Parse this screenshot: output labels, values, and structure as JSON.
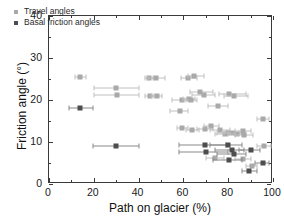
{
  "chart_data": {
    "type": "scatter",
    "title": "",
    "xlabel": "Path on glacier (%)",
    "ylabel": "Friction angle (°)",
    "xlim": [
      0,
      100
    ],
    "ylim": [
      0,
      40
    ],
    "xticks": [
      0,
      20,
      40,
      60,
      80,
      100
    ],
    "yticks": [
      0,
      10,
      20,
      30,
      40
    ],
    "xtick_minor_step": 10,
    "ytick_minor_step": 5,
    "grid": false,
    "legend_position": "upper left",
    "colors": {
      "travel": "#a9a9a9",
      "basal": "#4d4d4d",
      "axis": "#3a3a3a",
      "text": "#111111",
      "background": "#ffffff"
    },
    "series": [
      {
        "name": "Travel angles",
        "marker": "square",
        "color": "#a9a9a9",
        "points": [
          {
            "x": 14.0,
            "y": 25.5,
            "xerr_lo": 11.5,
            "xerr_hi": 16.5
          },
          {
            "x": 29.8,
            "y": 22.8,
            "xerr_lo": 20.0,
            "xerr_hi": 40.0
          },
          {
            "x": 30.2,
            "y": 21.3,
            "xerr_lo": 20.0,
            "xerr_hi": 40.0
          },
          {
            "x": 44.8,
            "y": 25.3,
            "xerr_lo": 43.0,
            "xerr_hi": 46.5
          },
          {
            "x": 47.8,
            "y": 25.2,
            "xerr_lo": 44.0,
            "xerr_hi": 52.0
          },
          {
            "x": 45.0,
            "y": 21.0,
            "xerr_lo": 43.0,
            "xerr_hi": 47.0
          },
          {
            "x": 48.0,
            "y": 20.9,
            "xerr_lo": 45.5,
            "xerr_hi": 50.5
          },
          {
            "x": 58.5,
            "y": 17.3,
            "xerr_lo": 54.0,
            "xerr_hi": 62.0
          },
          {
            "x": 59.5,
            "y": 20.0,
            "xerr_lo": 55.0,
            "xerr_hi": 63.0
          },
          {
            "x": 62.0,
            "y": 25.3,
            "xerr_lo": 59.0,
            "xerr_hi": 66.0
          },
          {
            "x": 64.8,
            "y": 25.6,
            "xerr_lo": 62.0,
            "xerr_hi": 69.0
          },
          {
            "x": 62.5,
            "y": 20.3,
            "xerr_lo": 60.0,
            "xerr_hi": 65.0
          },
          {
            "x": 63.5,
            "y": 19.9,
            "xerr_lo": 61.0,
            "xerr_hi": 66.0
          },
          {
            "x": 67.5,
            "y": 21.8,
            "xerr_lo": 63.0,
            "xerr_hi": 73.0
          },
          {
            "x": 69.0,
            "y": 21.3,
            "xerr_lo": 64.0,
            "xerr_hi": 74.0
          },
          {
            "x": 75.5,
            "y": 18.5,
            "xerr_lo": 71.0,
            "xerr_hi": 80.0
          },
          {
            "x": 80.5,
            "y": 21.4,
            "xerr_lo": 76.0,
            "xerr_hi": 88.0
          },
          {
            "x": 82.5,
            "y": 20.9,
            "xerr_lo": 78.0,
            "xerr_hi": 89.0
          },
          {
            "x": 59.5,
            "y": 13.4,
            "xerr_lo": 57.0,
            "xerr_hi": 62.0
          },
          {
            "x": 64.0,
            "y": 12.8,
            "xerr_lo": 61.0,
            "xerr_hi": 67.0
          },
          {
            "x": 69.5,
            "y": 13.0,
            "xerr_lo": 66.0,
            "xerr_hi": 73.0
          },
          {
            "x": 72.5,
            "y": 13.7,
            "xerr_lo": 69.0,
            "xerr_hi": 76.0
          },
          {
            "x": 76.5,
            "y": 12.8,
            "xerr_lo": 72.0,
            "xerr_hi": 81.0
          },
          {
            "x": 78.5,
            "y": 12.0,
            "xerr_lo": 74.0,
            "xerr_hi": 83.0
          },
          {
            "x": 80.0,
            "y": 12.2,
            "xerr_lo": 75.0,
            "xerr_hi": 85.0
          },
          {
            "x": 82.0,
            "y": 12.1,
            "xerr_lo": 78.0,
            "xerr_hi": 86.0
          },
          {
            "x": 84.0,
            "y": 12.0,
            "xerr_lo": 80.0,
            "xerr_hi": 88.0
          },
          {
            "x": 86.5,
            "y": 12.6,
            "xerr_lo": 83.0,
            "xerr_hi": 90.0
          },
          {
            "x": 87.0,
            "y": 11.6,
            "xerr_lo": 83.0,
            "xerr_hi": 91.0
          },
          {
            "x": 95.5,
            "y": 15.4,
            "xerr_lo": 93.0,
            "xerr_hi": 98.0
          },
          {
            "x": 96.0,
            "y": 9.0,
            "xerr_lo": 93.0,
            "xerr_hi": 99.0
          },
          {
            "x": 74.0,
            "y": 6.1,
            "xerr_lo": 70.0,
            "xerr_hi": 78.0
          },
          {
            "x": 86.5,
            "y": 6.0,
            "xerr_lo": 83.0,
            "xerr_hi": 90.0
          },
          {
            "x": 90.5,
            "y": 4.4,
            "xerr_lo": 88.0,
            "xerr_hi": 93.0
          }
        ]
      },
      {
        "name": "Basal friction angles",
        "marker": "square",
        "color": "#4d4d4d",
        "points": [
          {
            "x": 13.8,
            "y": 18.0,
            "xerr_lo": 9.0,
            "xerr_hi": 19.5
          },
          {
            "x": 30.0,
            "y": 9.0,
            "xerr_lo": 19.5,
            "xerr_hi": 40.0
          },
          {
            "x": 69.5,
            "y": 9.2,
            "xerr_lo": 58.0,
            "xerr_hi": 79.0
          },
          {
            "x": 70.0,
            "y": 7.7,
            "xerr_lo": 58.0,
            "xerr_hi": 80.0
          },
          {
            "x": 80.0,
            "y": 9.3,
            "xerr_lo": 72.0,
            "xerr_hi": 86.0
          },
          {
            "x": 81.5,
            "y": 8.0,
            "xerr_lo": 74.0,
            "xerr_hi": 87.0
          },
          {
            "x": 82.5,
            "y": 7.2,
            "xerr_lo": 75.0,
            "xerr_hi": 88.0
          },
          {
            "x": 80.5,
            "y": 5.8,
            "xerr_lo": 73.0,
            "xerr_hi": 86.0
          },
          {
            "x": 90.0,
            "y": 8.0,
            "xerr_lo": 85.0,
            "xerr_hi": 94.0
          },
          {
            "x": 89.5,
            "y": 3.0,
            "xerr_lo": 86.0,
            "xerr_hi": 93.0
          },
          {
            "x": 95.5,
            "y": 5.0,
            "xerr_lo": 92.0,
            "xerr_hi": 98.0
          }
        ]
      }
    ]
  }
}
